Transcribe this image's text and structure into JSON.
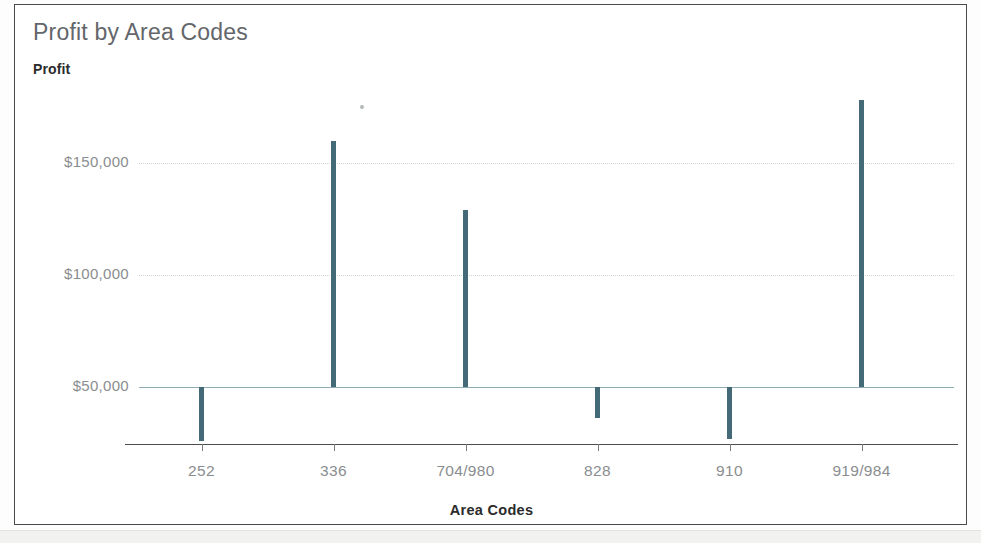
{
  "chart_data": {
    "type": "bar",
    "title": "Profit by Area Codes",
    "xlabel": "Area Codes",
    "ylabel": "Profit",
    "categories": [
      "252",
      "336",
      "704/980",
      "828",
      "910",
      "919/984"
    ],
    "values": [
      26000,
      160000,
      129000,
      36000,
      27000,
      178000
    ],
    "ytick_labels": [
      "$150,000",
      "$100,000",
      "$50,000"
    ],
    "ytick_values": [
      150000,
      100000,
      50000
    ],
    "ylim": [
      20000,
      185000
    ],
    "baseline_value": 50000,
    "grid": true,
    "legend": "none",
    "bar_color": "#456a77",
    "gridline_color": "#cfd4d6",
    "baseline_color": "#8fabb4",
    "axis_color": "#4d4d4d",
    "tick_label_color": "#8a8d8f",
    "title_color": "#63666a"
  },
  "chart": {
    "title": "Profit by Area Codes",
    "value_axis_title": "Profit",
    "category_axis_title": "Area Codes"
  }
}
